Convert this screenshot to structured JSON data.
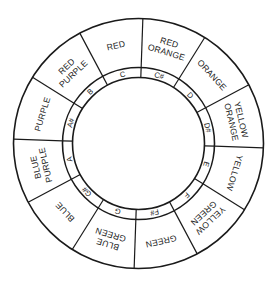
{
  "diagram": {
    "type": "color-music-wheel",
    "geometry": {
      "cx": 138.5,
      "cy": 143.5,
      "outer_radius": 125,
      "middle_radius": 76,
      "inner_radius": 66,
      "rotation_deg": 2,
      "sector_count": 12
    },
    "colors": {
      "stroke": "#1a1a1a",
      "background": "#ffffff",
      "text": "#222222"
    },
    "sectors": [
      {
        "color_lines": [
          "RED",
          "ORANGE"
        ],
        "note": "C#"
      },
      {
        "color_lines": [
          "ORANGE"
        ],
        "note": "D"
      },
      {
        "color_lines": [
          "YELLOW",
          "ORANGE"
        ],
        "note": "D#"
      },
      {
        "color_lines": [
          "YELLOW"
        ],
        "note": "E"
      },
      {
        "color_lines": [
          "YELLOW",
          "GREEN"
        ],
        "note": "F"
      },
      {
        "color_lines": [
          "GREEN"
        ],
        "note": "F#"
      },
      {
        "color_lines": [
          "BLUE",
          "GREEN"
        ],
        "note": "G"
      },
      {
        "color_lines": [
          "BLUE"
        ],
        "note": "G#"
      },
      {
        "color_lines": [
          "BLUE",
          "PURPLE"
        ],
        "note": "A"
      },
      {
        "color_lines": [
          "PURPLE"
        ],
        "note": "A#"
      },
      {
        "color_lines": [
          "RED",
          "PURPLE"
        ],
        "note": "B"
      },
      {
        "color_lines": [
          "RED"
        ],
        "note": "C"
      }
    ]
  }
}
